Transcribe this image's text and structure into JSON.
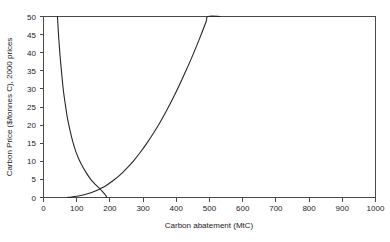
{
  "chart_data": {
    "type": "line",
    "title": "",
    "xlabel": "Carbon abatement (MtC)",
    "ylabel": "Carbon Price ($/tonnes C), 2000 prices",
    "xlim": [
      0,
      1000
    ],
    "ylim": [
      0,
      50
    ],
    "grid": false,
    "legend": null,
    "xticks": [
      0,
      100,
      200,
      300,
      400,
      500,
      600,
      700,
      800,
      900,
      1000
    ],
    "yticks": [
      0,
      5,
      10,
      15,
      20,
      25,
      30,
      35,
      40,
      45,
      50
    ],
    "xtick_labels": [
      "0",
      "100",
      "200",
      "300",
      "400",
      "500",
      "600",
      "700",
      "800",
      "900",
      "1000"
    ],
    "ytick_labels": [
      "0",
      "5",
      "10",
      "15",
      "20",
      "25",
      "30",
      "35",
      "40",
      "45",
      "50"
    ],
    "series": [
      {
        "name": "marginal-benefit-curve",
        "description": "Downward sloping convex curve (marginal benefit / demand)",
        "points": [
          [
            42,
            50.0
          ],
          [
            46,
            44.0
          ],
          [
            50,
            39.0
          ],
          [
            55,
            34.0
          ],
          [
            60,
            29.5
          ],
          [
            66,
            25.5
          ],
          [
            72,
            22.0
          ],
          [
            80,
            18.5
          ],
          [
            88,
            15.5
          ],
          [
            97,
            12.8
          ],
          [
            107,
            10.5
          ],
          [
            118,
            8.5
          ],
          [
            129,
            6.8
          ],
          [
            140,
            5.3
          ],
          [
            151,
            4.1
          ],
          [
            162,
            3.1
          ],
          [
            170,
            2.4
          ],
          [
            176,
            1.8
          ],
          [
            181,
            1.3
          ],
          [
            185,
            0.9
          ],
          [
            188,
            0.5
          ],
          [
            190,
            0.2
          ],
          [
            191,
            0.0
          ]
        ]
      },
      {
        "name": "marginal-cost-curve",
        "description": "Upward sloping convex curve (marginal abatement cost / supply)",
        "points": [
          [
            72,
            0.0
          ],
          [
            85,
            0.15
          ],
          [
            100,
            0.35
          ],
          [
            115,
            0.6
          ],
          [
            130,
            0.95
          ],
          [
            145,
            1.4
          ],
          [
            160,
            1.95
          ],
          [
            175,
            2.6
          ],
          [
            190,
            3.4
          ],
          [
            210,
            4.7
          ],
          [
            230,
            6.2
          ],
          [
            250,
            8.0
          ],
          [
            270,
            10.0
          ],
          [
            290,
            12.3
          ],
          [
            310,
            14.8
          ],
          [
            330,
            17.6
          ],
          [
            350,
            20.6
          ],
          [
            370,
            23.9
          ],
          [
            390,
            27.4
          ],
          [
            410,
            31.2
          ],
          [
            430,
            35.2
          ],
          [
            450,
            39.4
          ],
          [
            470,
            43.9
          ],
          [
            490,
            48.6
          ],
          [
            495,
            50.0
          ],
          [
            532,
            50.0
          ]
        ]
      }
    ]
  }
}
